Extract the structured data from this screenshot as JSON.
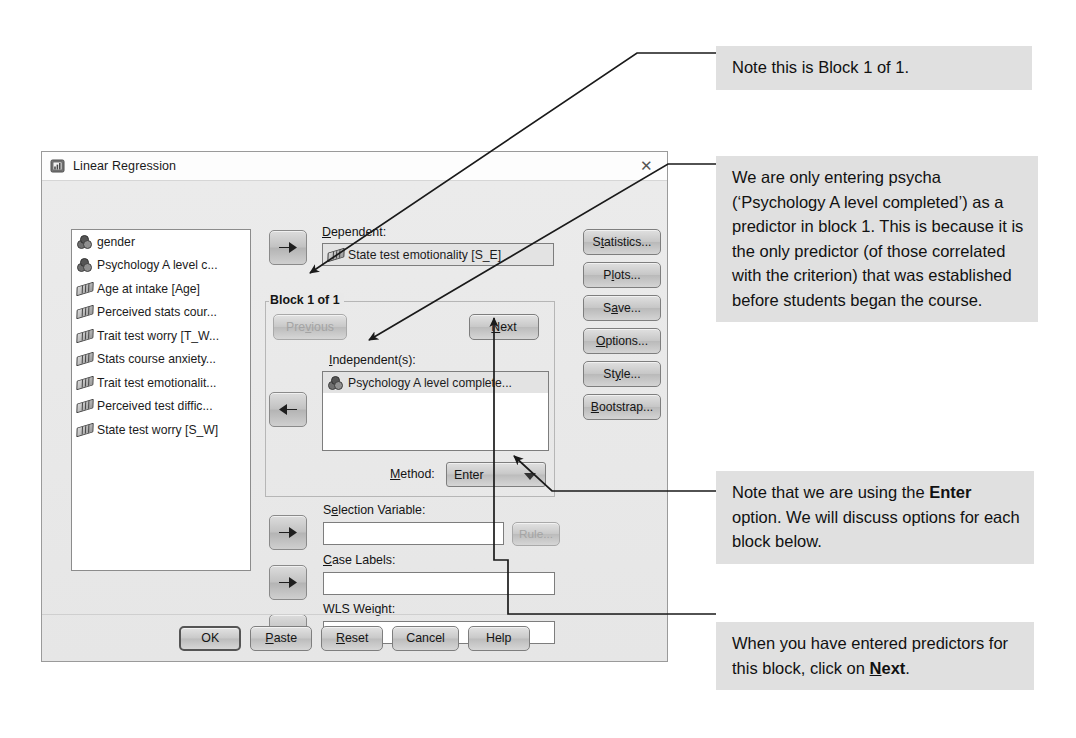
{
  "dialog": {
    "title": "Linear Regression",
    "icon": "spss-dialog-icon",
    "close_label": "✕",
    "variables": [
      {
        "label": "gender",
        "type": "nominal"
      },
      {
        "label": "Psychology A level c...",
        "type": "nominal"
      },
      {
        "label": "Age at intake [Age]",
        "type": "scale"
      },
      {
        "label": "Perceived stats cour...",
        "type": "scale"
      },
      {
        "label": "Trait test worry [T_W...",
        "type": "scale"
      },
      {
        "label": "Stats course anxiety...",
        "type": "scale"
      },
      {
        "label": "Trait test emotionalit...",
        "type": "scale"
      },
      {
        "label": "Perceived test diffic...",
        "type": "scale"
      },
      {
        "label": "State test worry [S_W]",
        "type": "scale"
      }
    ],
    "dependent": {
      "label": "Dependent:",
      "label_accel": "D",
      "value": "State test emotionality [S_E]",
      "value_type": "scale"
    },
    "block": {
      "group_title": "Block 1 of 1",
      "previous_label": "Previous",
      "previous_accel": "v",
      "next_label": "Next",
      "next_accel": "N",
      "independent_label": "Independent(s):",
      "independent_accel": "I",
      "independents": [
        {
          "label": "Psychology A level complete...",
          "type": "nominal"
        }
      ],
      "method_label": "Method:",
      "method_accel": "M",
      "method_value": "Enter"
    },
    "selection_variable": {
      "label": "Selection Variable:",
      "label_accel": "e",
      "value": "",
      "rule_button": "Rule...",
      "rule_disabled": true
    },
    "case_labels": {
      "label": "Case Labels:",
      "label_accel": "C",
      "value": ""
    },
    "wls_weight": {
      "label": "WLS Weight:",
      "label_accel": "h",
      "value": ""
    },
    "side_buttons": [
      {
        "label": "Statistics...",
        "accel": "t"
      },
      {
        "label": "Plots...",
        "accel": "l"
      },
      {
        "label": "Save...",
        "accel": "a"
      },
      {
        "label": "Options...",
        "accel": "O"
      },
      {
        "label": "Style...",
        "accel": "y"
      },
      {
        "label": "Bootstrap...",
        "accel": "B"
      }
    ],
    "bottom_buttons": [
      {
        "label": "OK",
        "accel": "",
        "default": true
      },
      {
        "label": "Paste",
        "accel": "P",
        "default": false
      },
      {
        "label": "Reset",
        "accel": "R",
        "default": false
      },
      {
        "label": "Cancel",
        "accel": "",
        "default": false
      },
      {
        "label": "Help",
        "accel": "",
        "default": false
      }
    ]
  },
  "notes": [
    {
      "id": "note-block",
      "text": "Note this is Block 1 of 1."
    },
    {
      "id": "note-predictor",
      "text": "We are only entering psycha (‘Psychology A level completed’) as a predictor in block 1. This is because it is the only predictor (of those correlated with the criterion) that was established before students began the course."
    },
    {
      "id": "note-enter",
      "text_before": "Note that we are using the ",
      "text_bold": "Enter",
      "text_after": " option. We will discuss options for each block below."
    },
    {
      "id": "note-next",
      "text_before": "When you have entered predictors for this block, click on ",
      "text_bold_underline": "N",
      "text_bold_rest": "ext",
      "text_after": "."
    }
  ],
  "colors": {
    "page_background": "#ffffff",
    "note_background": "#e0e0e0",
    "dialog_background": "#e9e9e9",
    "titlebar_background": "#fdfdfd",
    "field_background": "#ffffff",
    "leader_line": "#1a1a1a"
  }
}
